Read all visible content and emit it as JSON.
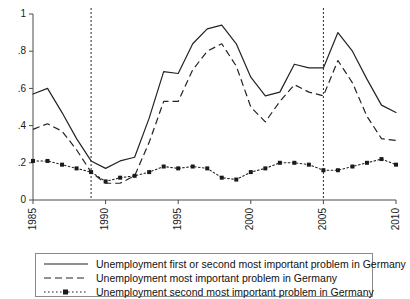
{
  "chart_data": {
    "type": "line",
    "title": "",
    "subtitle": "",
    "xlabel": "",
    "ylabel": "",
    "xlim": [
      1985,
      2010
    ],
    "ylim": [
      0,
      1
    ],
    "grid": false,
    "legend_position": "below-axes",
    "x_ticks": [
      "1985",
      "1990",
      "1995",
      "2000",
      "2005",
      "2010"
    ],
    "x_tick_values": [
      1985,
      1990,
      1995,
      2000,
      2005,
      2010
    ],
    "y_ticks": [
      "0",
      ".2",
      ".4",
      ".6",
      ".8",
      "1"
    ],
    "y_tick_values": [
      0,
      0.2,
      0.4,
      0.6,
      0.8,
      1
    ],
    "x": [
      1985,
      1986,
      1987,
      1988,
      1989,
      1990,
      1991,
      1992,
      1993,
      1994,
      1995,
      1996,
      1997,
      1998,
      1999,
      2000,
      2001,
      2002,
      2003,
      2004,
      2005,
      2006,
      2007,
      2008,
      2009,
      2010
    ],
    "annotations": [
      {
        "type": "vline",
        "x": 1989,
        "style": "dotted",
        "label": ""
      },
      {
        "type": "vline",
        "x": 2005,
        "style": "dotted",
        "label": ""
      }
    ],
    "series": [
      {
        "name": "Unemployment first or second most important problem in Germany",
        "style": "solid",
        "marker": "none",
        "values": [
          0.57,
          0.6,
          0.47,
          0.33,
          0.21,
          0.17,
          0.21,
          0.23,
          0.44,
          0.69,
          0.68,
          0.84,
          0.92,
          0.94,
          0.84,
          0.66,
          0.56,
          0.58,
          0.73,
          0.71,
          0.71,
          0.9,
          0.8,
          0.65,
          0.51,
          0.47
        ]
      },
      {
        "name": "Unemployment most important problem in Germany",
        "style": "dashed",
        "marker": "none",
        "values": [
          0.38,
          0.41,
          0.37,
          0.27,
          0.15,
          0.09,
          0.09,
          0.13,
          0.31,
          0.53,
          0.53,
          0.7,
          0.8,
          0.84,
          0.72,
          0.5,
          0.42,
          0.53,
          0.62,
          0.58,
          0.56,
          0.75,
          0.63,
          0.45,
          0.33,
          0.32
        ]
      },
      {
        "name": "Unemployment second most important problem in Germany",
        "style": "dotted",
        "marker": "square",
        "values": [
          0.21,
          0.21,
          0.19,
          0.17,
          0.15,
          0.1,
          0.12,
          0.13,
          0.15,
          0.18,
          0.17,
          0.18,
          0.17,
          0.12,
          0.11,
          0.15,
          0.17,
          0.2,
          0.2,
          0.19,
          0.16,
          0.16,
          0.18,
          0.2,
          0.22,
          0.19
        ]
      }
    ]
  },
  "legend": {
    "items": [
      {
        "label": "Unemployment first or second most important problem in Germany",
        "style": "solid"
      },
      {
        "label": "Unemployment most important problem in Germany",
        "style": "dashed"
      },
      {
        "label": "Unemployment second most important problem in Germany",
        "style": "dotted-marker"
      }
    ]
  }
}
